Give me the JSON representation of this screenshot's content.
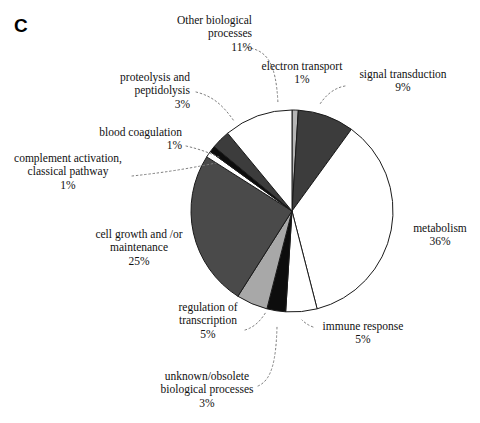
{
  "panel": {
    "letter": "C"
  },
  "chart_data": {
    "type": "pie",
    "title": "",
    "units": "percent",
    "legend_position": "labels-with-leader-lines",
    "start_angle_deg": 0,
    "direction": "clockwise",
    "total": 100,
    "categories": [
      "electron transport",
      "signal transduction",
      "metabolism",
      "immune response",
      "unknown/obsolete biological processes",
      "regulation of transcription",
      "cell growth and /or maintenance",
      "complement activation, classical pathway",
      "blood coagulation",
      "proteolysis and peptidolysis",
      "Other biological processes"
    ],
    "values": [
      1,
      9,
      36,
      5,
      3,
      5,
      25,
      1,
      1,
      3,
      11
    ],
    "slice_colors": [
      "#b6b6b6",
      "#3c3c3c",
      "#ffffff",
      "#ffffff",
      "#0d0d0d",
      "#a8a8a8",
      "#4a4a4a",
      "#ffffff",
      "#0d0d0d",
      "#3c3c3c",
      "#ffffff"
    ],
    "slice_outline": "#1a1a1a"
  },
  "labels": [
    {
      "key": "other-biological-processes",
      "line1": "Other biological",
      "line2": "processes",
      "pct": "11%"
    },
    {
      "key": "proteolysis-and-peptidolysis",
      "line1": "proteolysis and",
      "line2": "peptidolysis",
      "pct": "3%"
    },
    {
      "key": "blood-coagulation",
      "line1": "blood coagulation",
      "line2": "",
      "pct": "1%"
    },
    {
      "key": "complement-activation",
      "line1": "complement activation,",
      "line2": "classical pathway",
      "pct": "1%"
    },
    {
      "key": "cell-growth-and-or-maintenance",
      "line1": "cell growth and /or",
      "line2": "maintenance",
      "pct": "25%"
    },
    {
      "key": "regulation-of-transcription",
      "line1": "regulation of",
      "line2": "transcription",
      "pct": "5%"
    },
    {
      "key": "unknown-obsolete-biological-processes",
      "line1": "unknown/obsolete",
      "line2": "biological processes",
      "pct": "3%"
    },
    {
      "key": "electron-transport",
      "line1": "electron transport",
      "line2": "",
      "pct": "1%"
    },
    {
      "key": "signal-transduction",
      "line1": "signal transduction",
      "line2": "",
      "pct": "9%"
    },
    {
      "key": "metabolism",
      "line1": "metabolism",
      "line2": "",
      "pct": "36%"
    },
    {
      "key": "immune-response",
      "line1": "immune response",
      "line2": "",
      "pct": "5%"
    }
  ]
}
